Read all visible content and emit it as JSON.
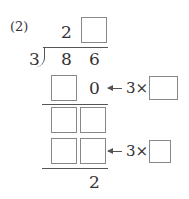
{
  "problem": {
    "label": "(2)",
    "divisor": "3",
    "dividend": [
      "8",
      "6"
    ],
    "quotient": [
      "2",
      ""
    ],
    "step1": {
      "product_digits": [
        "",
        "0"
      ],
      "multiplier_label": "3×",
      "multiplier_box": ""
    },
    "step2": {
      "remainder_digits": [
        "",
        ""
      ]
    },
    "step3": {
      "product_digits": [
        "",
        ""
      ],
      "multiplier_label": "3×",
      "multiplier_box": ""
    },
    "remainder": "2"
  }
}
